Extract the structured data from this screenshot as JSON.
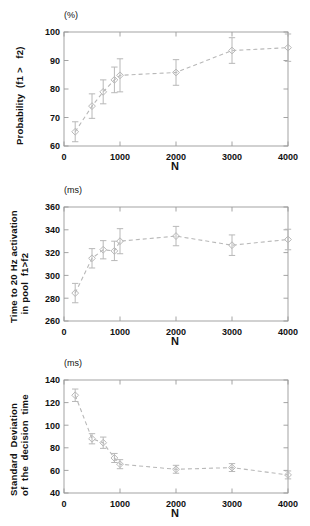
{
  "figure": {
    "xlabel": "N",
    "panels": [
      "probability",
      "time",
      "sd"
    ]
  },
  "chart_data": [
    {
      "type": "scatter",
      "id": "probability",
      "title": "",
      "unit_label": "(%)",
      "ylabel": "Probability  (f1 >   f2)",
      "xlabel": "N",
      "xlim": [
        0,
        4000
      ],
      "ylim": [
        60,
        100
      ],
      "xticks": [
        0,
        1000,
        2000,
        3000,
        4000
      ],
      "yticks": [
        60,
        70,
        80,
        90,
        100
      ],
      "grid": false,
      "legend": "none",
      "linestyle": "dashed",
      "marker": "diamond",
      "color": "#b8b8b8",
      "x": [
        200,
        500,
        700,
        900,
        1000,
        2000,
        3000,
        4000
      ],
      "y": [
        65.0,
        74.0,
        79.0,
        83.2,
        84.8,
        85.8,
        93.5,
        94.5
      ],
      "yerr": [
        3.5,
        4.3,
        4.2,
        4.5,
        5.8,
        4.5,
        4.5,
        4.8
      ]
    },
    {
      "type": "scatter",
      "id": "time",
      "title": "",
      "unit_label": "(ms)",
      "ylabel": "Time to 20 Hz activation\n   in pool  f1>f2",
      "xlabel": "N",
      "xlim": [
        0,
        4000
      ],
      "ylim": [
        260,
        360
      ],
      "xticks": [
        0,
        1000,
        2000,
        3000,
        4000
      ],
      "yticks": [
        260,
        280,
        300,
        320,
        340,
        360
      ],
      "grid": false,
      "legend": "none",
      "linestyle": "dashed",
      "marker": "diamond",
      "color": "#b8b8b8",
      "x": [
        200,
        500,
        700,
        900,
        1000,
        2000,
        3000,
        4000
      ],
      "y": [
        284.5,
        315.0,
        322.5,
        321.5,
        330.0,
        334.5,
        326.5,
        331.5
      ],
      "yerr": [
        8.5,
        8.5,
        8.0,
        8.5,
        11.0,
        8.5,
        9.0,
        9.0
      ]
    },
    {
      "type": "scatter",
      "id": "sd",
      "title": "",
      "unit_label": "(ms)",
      "ylabel": "Standard  Deviation\nof  the  decision  time",
      "xlabel": "N",
      "xlim": [
        0,
        4000
      ],
      "ylim": [
        40,
        140
      ],
      "xticks": [
        0,
        1000,
        2000,
        3000,
        4000
      ],
      "yticks": [
        40,
        60,
        80,
        100,
        120,
        140
      ],
      "grid": false,
      "legend": "none",
      "linestyle": "dashed",
      "marker": "diamond",
      "color": "#b8b8b8",
      "x": [
        200,
        500,
        700,
        900,
        1000,
        2000,
        3000,
        4000
      ],
      "y": [
        126.5,
        88.0,
        84.5,
        71.0,
        65.5,
        61.0,
        62.5,
        56.0
      ],
      "yerr": [
        5.5,
        4.5,
        5.0,
        4.0,
        4.0,
        3.5,
        3.5,
        3.5
      ]
    }
  ],
  "axis_text": {
    "p_yticks": [
      "100",
      "90",
      "80",
      "70",
      "60"
    ],
    "t_yticks": [
      "360",
      "340",
      "320",
      "300",
      "280",
      "260"
    ],
    "s_yticks": [
      "140",
      "120",
      "100",
      "80",
      "60",
      "40"
    ],
    "xticks": [
      "0",
      "1000",
      "2000",
      "3000",
      "4000"
    ]
  },
  "colors": {
    "data": "#b8b8b8",
    "axis": "#9a9a9a",
    "text": "#111111"
  }
}
